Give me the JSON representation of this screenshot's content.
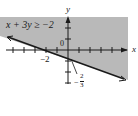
{
  "figure": {
    "inequality": "x + 3y ≥ −2",
    "axis_labels": {
      "x": "x",
      "y": "y"
    },
    "origin_label": "0",
    "x_intercept_label": "−2",
    "y_intercept_label": {
      "sign": "−",
      "numerator": "2",
      "denominator": "3"
    },
    "shade_color": "#b9b9b9",
    "line_color": "#1a1a1a",
    "boundary_line": {
      "equation": "x + 3y = −2",
      "style": "solid",
      "x_intercept": -2,
      "y_intercept": -0.6667
    },
    "shaded_side": "above",
    "x_ticks": [
      -5,
      -4,
      -3,
      -2,
      -1,
      1,
      2,
      3,
      4,
      5
    ],
    "y_ticks": [
      -3,
      -2,
      -1,
      1,
      2,
      3
    ]
  }
}
